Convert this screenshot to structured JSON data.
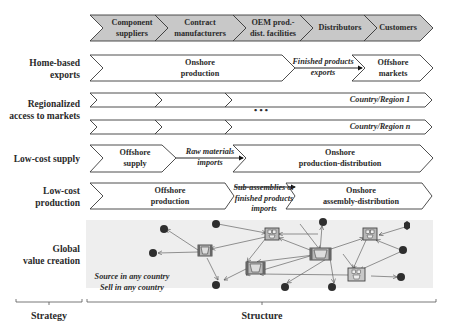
{
  "header": {
    "stages": [
      "Component suppliers",
      "Contract manufacturers",
      "OEM prod.- dist. facilities",
      "Distributors",
      "Customers"
    ],
    "stage_lines": [
      [
        "Component",
        "suppliers"
      ],
      [
        "Contract",
        "manufacturers"
      ],
      [
        "OEM prod.-",
        "dist. facilities"
      ],
      [
        "Distributors"
      ],
      [
        "Customers"
      ]
    ],
    "fill_color": "#c8c8c8"
  },
  "rows": [
    {
      "strategy": [
        "Home-based",
        "exports"
      ],
      "segments": [
        {
          "lines": [
            "Onshore",
            "production"
          ],
          "style": "bold"
        },
        {
          "lines": [
            "Finished products",
            "exports"
          ],
          "style": "italic-flow"
        },
        {
          "lines": [
            "Offshore",
            "markets"
          ],
          "style": "bold"
        }
      ]
    },
    {
      "strategy": [
        "Regionalized",
        "access to markets"
      ],
      "segments": [
        {
          "lines": [
            "Country/Region 1"
          ],
          "style": "italic"
        },
        {
          "lines": [
            "Country/Region n"
          ],
          "style": "italic"
        }
      ],
      "ellipsis": "• • •"
    },
    {
      "strategy": [
        "Low-cost supply"
      ],
      "segments": [
        {
          "lines": [
            "Offshore",
            "supply"
          ],
          "style": "bold"
        },
        {
          "lines": [
            "Raw materials",
            "imports"
          ],
          "style": "italic-flow"
        },
        {
          "lines": [
            "Onshore",
            "production-distribution"
          ],
          "style": "bold"
        }
      ]
    },
    {
      "strategy": [
        "Low-cost",
        "production"
      ],
      "segments": [
        {
          "lines": [
            "Offshore",
            "production"
          ],
          "style": "bold"
        },
        {
          "lines": [
            "Sub-assemblies or",
            "finished products",
            "imports"
          ],
          "style": "italic-flow"
        },
        {
          "lines": [
            "Onshore",
            "assembly-distribution"
          ],
          "style": "bold"
        }
      ]
    },
    {
      "strategy": [
        "Global",
        "value creation"
      ],
      "network_caption": [
        "Source in any country",
        "Sell in any country"
      ]
    }
  ],
  "footer": {
    "strategy_label": "Strategy",
    "structure_label": "Structure"
  },
  "colors": {
    "stroke": "#3a3a3a",
    "network_bg": "#eeeeee",
    "node_dark": "#2e2e2e",
    "facility_fill": "#b8b8b8",
    "facility_frame": "#6a6a6a"
  }
}
